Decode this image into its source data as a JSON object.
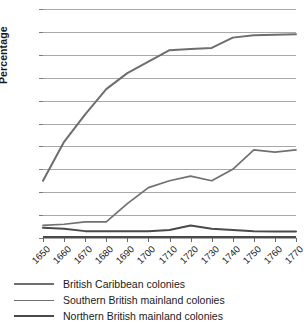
{
  "chart_data": {
    "type": "line",
    "title": "",
    "xlabel": "",
    "ylabel": "Percentage",
    "xlim": [
      1650,
      1770
    ],
    "ylim": [
      0,
      100
    ],
    "grid": true,
    "legend_position": "bottom",
    "categories": [
      1650,
      1660,
      1670,
      1680,
      1690,
      1700,
      1710,
      1720,
      1730,
      1740,
      1750,
      1760,
      1770
    ],
    "x_tick_labels": [
      "1650",
      "1660",
      "1670",
      "1680",
      "1690",
      "1700",
      "1710",
      "1720",
      "1730",
      "1740",
      "1750",
      "1760",
      "1770"
    ],
    "y_tick_labels": [
      "0",
      "10",
      "20",
      "30",
      "40",
      "50",
      "60",
      "70",
      "80",
      "90",
      "100"
    ],
    "y_ticks": [
      0,
      10,
      20,
      30,
      40,
      50,
      60,
      70,
      80,
      90,
      100
    ],
    "series": [
      {
        "name": "British Caribbean colonies",
        "color": "#6e6e6e",
        "width": 2.0,
        "values": [
          25,
          42,
          54,
          65,
          72,
          77,
          82,
          82.5,
          83,
          87.5,
          88.5,
          88.8,
          89
        ]
      },
      {
        "name": "Southern British mainland colonies",
        "color": "#707070",
        "width": 1.7,
        "values": [
          5.5,
          6,
          7,
          7,
          15,
          22,
          25,
          27,
          25,
          30,
          38.5,
          37.5,
          38.5
        ]
      },
      {
        "name": "Northern British mainland colonies",
        "color": "#4a4a4a",
        "width": 2.0,
        "values": [
          4.5,
          4,
          3,
          3,
          3,
          3,
          3.5,
          5.5,
          4,
          3.5,
          3,
          2.8,
          2.8
        ]
      }
    ]
  },
  "legend": {
    "items": [
      {
        "label": "British Caribbean colonies",
        "color": "#6e6e6e",
        "width": 2.0
      },
      {
        "label": "Southern British mainland colonies",
        "color": "#707070",
        "width": 1.7
      },
      {
        "label": "Northern British mainland colonies",
        "color": "#4a4a4a",
        "width": 2.6
      }
    ]
  }
}
